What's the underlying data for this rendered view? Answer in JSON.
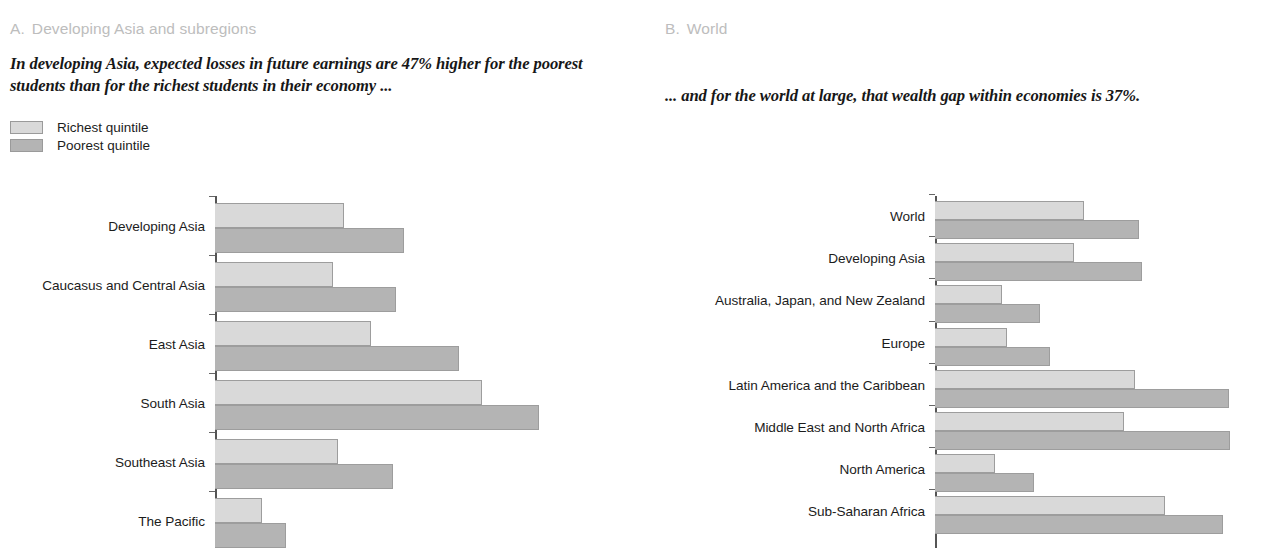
{
  "panel_a": {
    "heading_letter": "A.",
    "heading_text": "Developing Asia and subregions",
    "subtitle": "In developing Asia, expected losses in future earnings are 47% higher for the poorest students than for the richest students in their economy ...",
    "legend": [
      {
        "label": "Richest quintile",
        "color": "#d9d9d9"
      },
      {
        "label": "Poorest quintile",
        "color": "#b4b4b4"
      }
    ]
  },
  "panel_b": {
    "heading_letter": "B.",
    "heading_text": "World",
    "subtitle": "... and for the world at large, that wealth gap within economies is 37%."
  },
  "colors": {
    "richest": "#d9d9d9",
    "poorest": "#b4b4b4",
    "bar_border": "#9d9d9d",
    "axis": "#555555",
    "heading_gray": "#bdbdbd",
    "text": "#1c1c1c"
  },
  "chart_data": [
    {
      "id": "panel-a",
      "type": "bar",
      "orientation": "horizontal",
      "title": "A. Developing Asia and subregions",
      "subtitle": "In developing Asia, expected losses in future earnings are 47% higher for the poorest students than for the richest students in their economy ...",
      "xlabel": "",
      "ylabel": "",
      "grid": false,
      "legend_position": "top-left",
      "axis_visible": true,
      "xlim": [
        0,
        100
      ],
      "categories": [
        "Developing Asia",
        "Caucasus and Central Asia",
        "East Asia",
        "South Asia",
        "Southeast Asia",
        "The Pacific"
      ],
      "series": [
        {
          "name": "Richest quintile",
          "color": "#d9d9d9",
          "values": [
            39.7,
            36.3,
            48.0,
            82.5,
            38.0,
            14.4
          ]
        },
        {
          "name": "Poorest quintile",
          "color": "#b4b4b4",
          "values": [
            58.3,
            55.8,
            75.2,
            100.0,
            55.0,
            21.8
          ]
        }
      ]
    },
    {
      "id": "panel-b",
      "type": "bar",
      "orientation": "horizontal",
      "title": "B. World",
      "subtitle": "... and for the world at large, that wealth gap within economies is 37%.",
      "xlabel": "",
      "ylabel": "",
      "grid": false,
      "legend_position": "none",
      "axis_visible": true,
      "xlim": [
        0,
        100
      ],
      "categories": [
        "World",
        "Developing Asia",
        "Australia, Japan, and New Zealand",
        "Europe",
        "Latin America and the Caribbean",
        "Middle East and North Africa",
        "North America",
        "Sub-Saharan Africa"
      ],
      "series": [
        {
          "name": "Richest quintile",
          "color": "#d9d9d9",
          "values": [
            51.6,
            48.4,
            23.2,
            24.9,
            69.4,
            65.6,
            21.0,
            79.7
          ]
        },
        {
          "name": "Poorest quintile",
          "color": "#b4b4b4",
          "values": [
            70.8,
            71.9,
            36.5,
            40.0,
            102.1,
            102.5,
            34.4,
            100.0
          ]
        }
      ]
    }
  ]
}
